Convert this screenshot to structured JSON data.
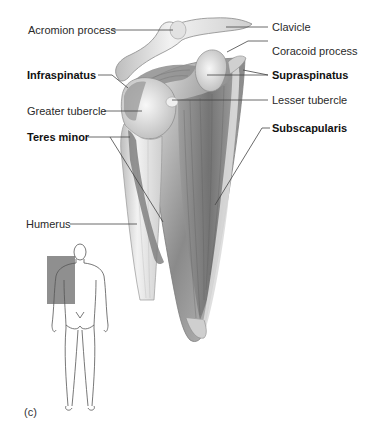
{
  "figure": {
    "panel_label": "(c)",
    "colors": {
      "background": "#ffffff",
      "label_text": "#2a2a2a",
      "leader_line": "#444444",
      "bone_light": "#e9e9e9",
      "muscle_dark": "#7a7a7a",
      "locator_box": "#8f8f8f"
    }
  },
  "labels": {
    "left": [
      {
        "text": "Acromion process",
        "bold": false
      },
      {
        "text": "Infraspinatus",
        "bold": true
      },
      {
        "text": "Greater tubercle",
        "bold": false
      },
      {
        "text": "Teres minor",
        "bold": true
      },
      {
        "text": "Humerus",
        "bold": false
      }
    ],
    "right": [
      {
        "text": "Clavicle",
        "bold": false
      },
      {
        "text": "Coracoid process",
        "bold": false
      },
      {
        "text": "Supraspinatus",
        "bold": true
      },
      {
        "text": "Lesser tubercle",
        "bold": false
      },
      {
        "text": "Subscapularis",
        "bold": true
      }
    ]
  },
  "locator": {
    "description": "Posterior body outline with shaded shoulder region"
  }
}
